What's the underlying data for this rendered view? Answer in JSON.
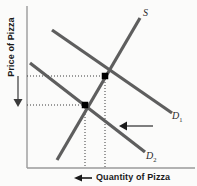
{
  "figure": {
    "background_color": "#fbfbfa"
  },
  "axes": {
    "y_label": "Price of Pizza",
    "x_label": "Quantity of Pizza",
    "axis_color": "#9a9a9a",
    "origin": {
      "x": 27,
      "y": 168
    },
    "y_top": 6,
    "x_right": 195
  },
  "annotations": {
    "price_arrow": {
      "name": "price-decrease-arrow",
      "direction": "down",
      "x": 18,
      "y_start": 76,
      "y_end": 105,
      "color": "#4d4d4d"
    },
    "quantity_arrow": {
      "name": "quantity-decrease-arrow",
      "direction": "left",
      "y": 178,
      "x_start": 92,
      "x_end": 76,
      "color": "#1a1a1a"
    },
    "shift_arrow": {
      "name": "demand-shift-arrow",
      "direction": "left",
      "y": 126,
      "x_start": 153,
      "x_end": 121,
      "color": "#1a1a1a"
    }
  },
  "chart_data": {
    "type": "line",
    "xlabel": "Quantity of Pizza",
    "ylabel": "Price of Pizza",
    "grid": false,
    "legend": "inline-curve-labels",
    "curve_color": "#5e5e5e",
    "curve_width": 3.2,
    "series": [
      {
        "name": "S",
        "label": "S",
        "role": "supply",
        "points": [
          [
            57,
            160
          ],
          [
            140,
            18
          ]
        ]
      },
      {
        "name": "D1",
        "label": "D",
        "sublabel": "1",
        "role": "initial-demand",
        "points": [
          [
            52,
            30
          ],
          [
            172,
            113
          ]
        ]
      },
      {
        "name": "D2",
        "label": "D",
        "sublabel": "2",
        "role": "shifted-demand",
        "points": [
          [
            30,
            63
          ],
          [
            145,
            152
          ]
        ]
      }
    ],
    "equilibria": [
      {
        "name": "initial-equilibrium",
        "curves": [
          "S",
          "D1"
        ],
        "x": 105,
        "y": 76,
        "marker": "square",
        "marker_color": "#000000",
        "marker_size": 6
      },
      {
        "name": "new-equilibrium",
        "curves": [
          "S",
          "D2"
        ],
        "x": 85,
        "y": 105,
        "marker": "square",
        "marker_color": "#000000",
        "marker_size": 6
      }
    ],
    "guide_lines": {
      "color": "#3a3a3a",
      "dash": "1,2",
      "horizontal": [
        {
          "name": "initial-price-guide",
          "y": 76,
          "x_start": 27,
          "x_end": 105
        },
        {
          "name": "new-price-guide",
          "y": 105,
          "x_start": 27,
          "x_end": 85
        }
      ],
      "vertical": [
        {
          "name": "initial-quantity-guide",
          "x": 105,
          "y_start": 76,
          "y_end": 168
        },
        {
          "name": "new-quantity-guide",
          "x": 85,
          "y_start": 105,
          "y_end": 168
        }
      ]
    }
  }
}
